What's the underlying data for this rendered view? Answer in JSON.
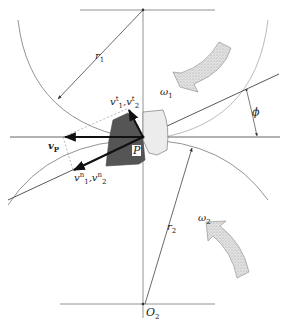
{
  "diagram": {
    "labels": {
      "r1": "r",
      "r1_sub": "1",
      "r2": "r",
      "r2_sub": "2",
      "omega1": "ω",
      "omega1_sub": "1",
      "omega2": "ω",
      "omega2_sub": "2",
      "phi": "ϕ",
      "vp": "v",
      "vp_sub": "P",
      "P": "P",
      "O2": "O",
      "O2_sub": "2",
      "vt": "v",
      "vt_sup1": "t",
      "vt_sub1": "1",
      "vt_sep": ",",
      "vt_sup2": "t",
      "vt_sub2": "2",
      "vn": "v",
      "vn_sup1": "n",
      "vn_sub1": "1",
      "vn_sep": ",",
      "vn_sup2": "n",
      "vn_sub2": "2"
    },
    "colors": {
      "line": "#555555",
      "heavy": "#111111",
      "tooth_dark": "#555555",
      "tooth_light": "#e6e6e6",
      "arrow_fill": "#d8d8d8"
    }
  }
}
